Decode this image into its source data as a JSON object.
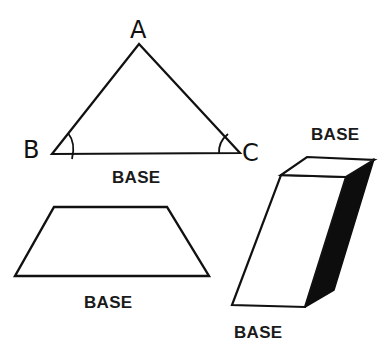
{
  "figure": {
    "background": "#ffffff",
    "stroke_color": "#111111",
    "shade_color": "#0d0d0d"
  },
  "triangle": {
    "vertices": {
      "A": "A",
      "B": "B",
      "C": "C"
    },
    "base_label": "BASE"
  },
  "trapezoid": {
    "base_label": "BASE"
  },
  "prism": {
    "top_base_label": "BASE",
    "bottom_base_label": "BASE"
  }
}
